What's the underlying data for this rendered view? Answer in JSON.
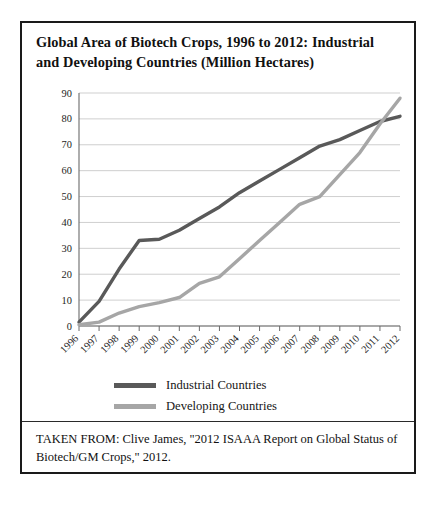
{
  "figure": {
    "title": "Global Area of Biotech Crops, 1996 to 2012: Industrial and Developing Countries (Million Hectares)",
    "title_line1": "Global Area of Biotech Crops, 1996 to 2012: Industrial",
    "title_line2": "and Developing Countries (Million Hectares)",
    "source_note": "TAKEN FROM: Clive James, \"2012 ISAAA Report on Global Status of Biotech/GM Crops,\" 2012."
  },
  "legend": {
    "position": "bottom-center",
    "entries": [
      {
        "label": "Industrial Countries",
        "color": "#595959"
      },
      {
        "label": "Developing Countries",
        "color": "#a6a6a6"
      }
    ]
  },
  "chart_data": {
    "type": "line",
    "title": "Global Area of Biotech Crops, 1996 to 2012: Industrial and Developing Countries (Million Hectares)",
    "xlabel": "",
    "ylabel": "",
    "x": [
      1996,
      1997,
      1998,
      1999,
      2000,
      2001,
      2002,
      2003,
      2004,
      2005,
      2006,
      2007,
      2008,
      2009,
      2010,
      2011,
      2012
    ],
    "xtick_labels": [
      "1996",
      "1997",
      "1998",
      "1999",
      "2000",
      "2001",
      "2002",
      "2003",
      "2004",
      "2005",
      "2006",
      "2007",
      "2008",
      "2009",
      "2010",
      "2011",
      "2012"
    ],
    "ytick_labels": [
      "0",
      "10",
      "20",
      "30",
      "40",
      "50",
      "60",
      "70",
      "80",
      "90"
    ],
    "ylim": [
      0,
      90
    ],
    "ytick_step": 10,
    "grid": true,
    "series": [
      {
        "name": "Industrial Countries",
        "color": "#595959",
        "values": [
          1.5,
          9.5,
          22.0,
          33.0,
          33.5,
          37.0,
          41.5,
          46.0,
          51.5,
          56.0,
          60.5,
          65.0,
          69.5,
          72.0,
          75.5,
          79.0,
          81.0
        ]
      },
      {
        "name": "Developing Countries",
        "color": "#a6a6a6",
        "values": [
          0.5,
          1.5,
          5.0,
          7.5,
          9.0,
          11.0,
          16.5,
          19.0,
          26.0,
          33.0,
          40.0,
          47.0,
          50.0,
          58.5,
          67.0,
          78.0,
          88.0
        ]
      }
    ]
  }
}
